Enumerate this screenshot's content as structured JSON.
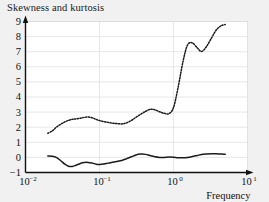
{
  "title": "Skewness and kurtosis",
  "axis": {
    "x_name": "Frequency",
    "x_ticks": [
      {
        "mantissa": "10",
        "exp": "-2",
        "value": 0.01
      },
      {
        "mantissa": "10",
        "exp": "-1",
        "value": 0.1
      },
      {
        "mantissa": "10",
        "exp": "0",
        "value": 1
      },
      {
        "mantissa": "10",
        "exp": "1",
        "value": 10
      }
    ],
    "y_ticks": [
      "-1",
      "0",
      "1",
      "2",
      "3",
      "4",
      "5",
      "6",
      "7",
      "8",
      "9"
    ]
  },
  "colors": {
    "background": "#f1f1f1",
    "plot_background": "#ffffff",
    "grid": "#dcdcdc",
    "axis": "#111111",
    "curve": "#1a1a1a",
    "text": "#111111"
  },
  "chart_data": {
    "type": "line",
    "title": "Skewness and kurtosis",
    "xlabel": "Frequency",
    "ylabel": "",
    "xscale": "log",
    "xlim": [
      0.01,
      10
    ],
    "ylim": [
      -1,
      9
    ],
    "grid": true,
    "legend": "none",
    "series": [
      {
        "name": "skewness",
        "style": "solid",
        "x": [
          0.02,
          0.023,
          0.026,
          0.03,
          0.034,
          0.038,
          0.043,
          0.048,
          0.055,
          0.062,
          0.07,
          0.08,
          0.09,
          0.1,
          0.115,
          0.13,
          0.15,
          0.17,
          0.2,
          0.23,
          0.27,
          0.31,
          0.36,
          0.42,
          0.48,
          0.56,
          0.65,
          0.75,
          0.87,
          1.0,
          1.15,
          1.35,
          1.55,
          1.8,
          2.1,
          2.4,
          2.8,
          3.3,
          3.8,
          4.4,
          5.0
        ],
        "y": [
          0.1,
          0.08,
          0.0,
          -0.22,
          -0.45,
          -0.58,
          -0.6,
          -0.52,
          -0.4,
          -0.34,
          -0.33,
          -0.38,
          -0.45,
          -0.47,
          -0.44,
          -0.38,
          -0.32,
          -0.27,
          -0.2,
          -0.1,
          0.04,
          0.16,
          0.22,
          0.2,
          0.12,
          0.04,
          0.0,
          0.0,
          0.02,
          0.01,
          -0.02,
          -0.03,
          0.0,
          0.06,
          0.13,
          0.19,
          0.22,
          0.24,
          0.24,
          0.22,
          0.21
        ]
      },
      {
        "name": "kurtosis",
        "style": "dotted",
        "x": [
          0.02,
          0.023,
          0.026,
          0.03,
          0.034,
          0.038,
          0.043,
          0.048,
          0.055,
          0.062,
          0.07,
          0.08,
          0.09,
          0.1,
          0.115,
          0.13,
          0.15,
          0.17,
          0.2,
          0.23,
          0.27,
          0.31,
          0.36,
          0.42,
          0.48,
          0.56,
          0.65,
          0.75,
          0.87,
          1.0,
          1.15,
          1.35,
          1.55,
          1.8,
          2.1,
          2.4,
          2.8,
          3.3,
          3.8,
          4.4,
          5.0
        ],
        "y": [
          1.6,
          1.75,
          2.0,
          2.2,
          2.35,
          2.45,
          2.52,
          2.55,
          2.6,
          2.65,
          2.68,
          2.62,
          2.52,
          2.44,
          2.37,
          2.32,
          2.27,
          2.24,
          2.22,
          2.28,
          2.45,
          2.65,
          2.85,
          3.05,
          3.18,
          3.15,
          3.02,
          2.92,
          2.9,
          3.3,
          4.6,
          6.4,
          7.45,
          7.58,
          7.25,
          7.02,
          7.35,
          7.95,
          8.45,
          8.72,
          8.8
        ]
      }
    ]
  }
}
